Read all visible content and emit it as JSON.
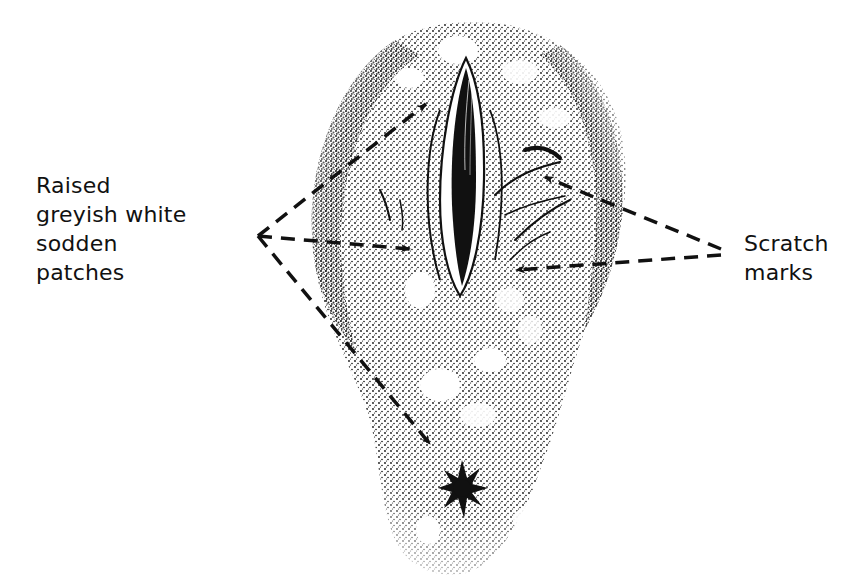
{
  "diagram": {
    "type": "anatomical-illustration",
    "style": "black-and-white stippled drawing",
    "labels": {
      "left": {
        "lines": [
          "Raised",
          "greyish white",
          "sodden",
          "patches"
        ],
        "text": "Raised greyish white sodden patches",
        "arrow_count": 3,
        "arrow_style": "dashed"
      },
      "right": {
        "lines": [
          "Scratch",
          "marks"
        ],
        "text": "Scratch marks",
        "arrow_count": 2,
        "arrow_style": "dashed"
      }
    },
    "colors": {
      "ink": "#111111",
      "background": "#ffffff"
    }
  }
}
